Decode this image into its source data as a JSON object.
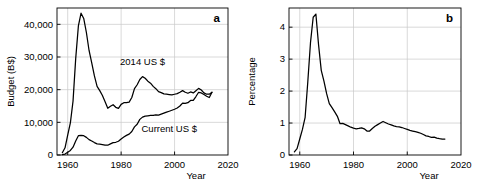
{
  "figure": {
    "panels": [
      "a",
      "b"
    ],
    "background_color": "#ffffff",
    "line_color": "#000000",
    "grid_color": "#c8c8c8"
  },
  "panel_a": {
    "letter": "a",
    "ylabel": "Budget (B$)",
    "xlabel": "Year",
    "ytick_labels": [
      "0",
      "10,000",
      "20,000",
      "30,000",
      "40,000"
    ],
    "xtick_labels": [
      "1960",
      "1980",
      "2000",
      "2020"
    ],
    "series_label_constant": "2014 US $",
    "series_label_current": "Current US $"
  },
  "panel_b": {
    "letter": "b",
    "ylabel": "Percentage",
    "xlabel": "Year",
    "ytick_labels": [
      "0",
      "1",
      "2",
      "3",
      "4"
    ],
    "xtick_labels": [
      "1960",
      "1980",
      "2000",
      "2020"
    ]
  },
  "chart_data": [
    {
      "type": "line",
      "panel": "a",
      "title": "",
      "xlabel": "Year",
      "ylabel": "Budget (B$)",
      "xlim": [
        1956,
        2020
      ],
      "ylim": [
        0,
        45000
      ],
      "xticks": [
        1960,
        1980,
        2000,
        2020
      ],
      "yticks": [
        0,
        10000,
        20000,
        30000,
        40000
      ],
      "grid": true,
      "legend": "inline-annotations",
      "series": [
        {
          "name": "2014 US $",
          "x": [
            1958,
            1959,
            1960,
            1961,
            1962,
            1963,
            1964,
            1965,
            1966,
            1967,
            1968,
            1969,
            1970,
            1971,
            1972,
            1973,
            1974,
            1975,
            1976,
            1977,
            1978,
            1979,
            1980,
            1981,
            1982,
            1983,
            1984,
            1985,
            1986,
            1987,
            1988,
            1989,
            1990,
            1991,
            1992,
            1993,
            1994,
            1995,
            1996,
            1997,
            1998,
            1999,
            2000,
            2001,
            2002,
            2003,
            2004,
            2005,
            2006,
            2007,
            2008,
            2009,
            2010,
            2011,
            2012,
            2013,
            2014
          ],
          "values": [
            700,
            2200,
            6100,
            9800,
            16500,
            29500,
            39500,
            43400,
            41800,
            37500,
            32000,
            28200,
            24200,
            21000,
            19700,
            18200,
            16300,
            14300,
            14900,
            15400,
            14600,
            14300,
            15500,
            16000,
            16000,
            16200,
            17600,
            20300,
            21500,
            23100,
            24000,
            23500,
            22600,
            22000,
            21000,
            20300,
            19400,
            19100,
            18700,
            18600,
            18500,
            18400,
            18600,
            18800,
            19200,
            19700,
            19200,
            18900,
            19300,
            19000,
            19700,
            20400,
            19900,
            19000,
            18600,
            18600,
            19200
          ]
        },
        {
          "name": "Current US $",
          "x": [
            1958,
            1959,
            1960,
            1961,
            1962,
            1963,
            1964,
            1965,
            1966,
            1967,
            1968,
            1969,
            1970,
            1971,
            1972,
            1973,
            1974,
            1975,
            1976,
            1977,
            1978,
            1979,
            1980,
            1981,
            1982,
            1983,
            1984,
            1985,
            1986,
            1987,
            1988,
            1989,
            1990,
            1991,
            1992,
            1993,
            1994,
            1995,
            1996,
            1997,
            1998,
            1999,
            2000,
            2001,
            2002,
            2003,
            2004,
            2005,
            2006,
            2007,
            2008,
            2009,
            2010,
            2011,
            2012,
            2013,
            2014
          ],
          "values": [
            90,
            300,
            840,
            1400,
            2400,
            4300,
            5900,
            6000,
            5900,
            5400,
            4700,
            4300,
            3800,
            3400,
            3300,
            3200,
            3000,
            3000,
            3400,
            3800,
            3900,
            4200,
            4900,
            5500,
            6000,
            6400,
            7200,
            8600,
            9400,
            10900,
            11600,
            11900,
            12000,
            12100,
            12100,
            12300,
            12200,
            12500,
            12800,
            13100,
            13400,
            13700,
            14000,
            14400,
            15000,
            15900,
            15800,
            16000,
            16700,
            16700,
            17900,
            19200,
            19000,
            18500,
            18000,
            17600,
            19200
          ]
        }
      ]
    },
    {
      "type": "line",
      "panel": "b",
      "title": "",
      "xlabel": "Year",
      "ylabel": "Percentage",
      "xlim": [
        1956,
        2020
      ],
      "ylim": [
        0,
        4.6
      ],
      "xticks": [
        1960,
        1980,
        2000,
        2020
      ],
      "yticks": [
        0,
        1,
        2,
        3,
        4
      ],
      "grid": true,
      "series": [
        {
          "name": "Percentage",
          "x": [
            1958,
            1959,
            1960,
            1961,
            1962,
            1963,
            1964,
            1965,
            1966,
            1967,
            1968,
            1969,
            1970,
            1971,
            1972,
            1973,
            1974,
            1975,
            1976,
            1977,
            1978,
            1979,
            1980,
            1981,
            1982,
            1983,
            1984,
            1985,
            1986,
            1987,
            1988,
            1989,
            1990,
            1991,
            1992,
            1993,
            1994,
            1995,
            1996,
            1997,
            1998,
            1999,
            2000,
            2001,
            2002,
            2003,
            2004,
            2005,
            2006,
            2007,
            2008,
            2009,
            2010,
            2011,
            2012,
            2013,
            2014
          ],
          "values": [
            0.1,
            0.2,
            0.5,
            0.8,
            1.18,
            2.29,
            3.52,
            4.31,
            4.41,
            3.45,
            2.65,
            2.31,
            1.92,
            1.61,
            1.48,
            1.35,
            1.21,
            0.98,
            0.99,
            0.95,
            0.91,
            0.87,
            0.84,
            0.82,
            0.83,
            0.85,
            0.82,
            0.75,
            0.75,
            0.83,
            0.9,
            0.95,
            1.0,
            1.05,
            1.01,
            0.97,
            0.94,
            0.91,
            0.89,
            0.88,
            0.86,
            0.83,
            0.8,
            0.77,
            0.75,
            0.73,
            0.71,
            0.68,
            0.64,
            0.6,
            0.58,
            0.55,
            0.56,
            0.53,
            0.51,
            0.5,
            0.5
          ]
        }
      ]
    }
  ]
}
